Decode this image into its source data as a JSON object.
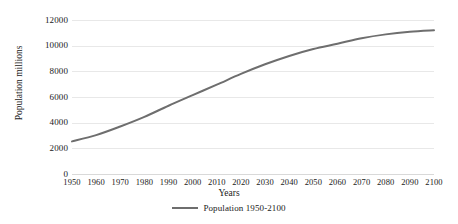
{
  "chart_data": {
    "type": "line",
    "title": "",
    "xlabel": "Years",
    "ylabel": "Population millions",
    "xlim": [
      1950,
      2100
    ],
    "ylim": [
      0,
      12000
    ],
    "ytick_step": 2000,
    "grid": true,
    "legend_position": "bottom-center",
    "line_color": "#6e6e6e",
    "x": [
      1950,
      1960,
      1970,
      1980,
      1990,
      2000,
      2010,
      2020,
      2030,
      2040,
      2050,
      2060,
      2070,
      2080,
      2090,
      2100
    ],
    "xticklabels": [
      "1950",
      "1960",
      "1970",
      "1980",
      "1990",
      "2000",
      "2010",
      "2020",
      "2030",
      "2040",
      "2050",
      "2060",
      "2070",
      "2080",
      "2090",
      "2100"
    ],
    "yticklabels": [
      "0",
      "2000",
      "4000",
      "6000",
      "8000",
      "10000",
      "12000"
    ],
    "yticks": [
      0,
      2000,
      4000,
      6000,
      8000,
      10000,
      12000
    ],
    "series": [
      {
        "name": "Population 1950-2100",
        "color": "#6e6e6e",
        "values": [
          2540,
          3030,
          3700,
          4450,
          5320,
          6145,
          6960,
          7800,
          8550,
          9200,
          9740,
          10150,
          10580,
          10880,
          11080,
          11200
        ]
      }
    ],
    "legend": [
      "Population 1950-2100"
    ]
  },
  "axes": {
    "y_title": "Population millions",
    "x_title": "Years"
  },
  "legend": {
    "entries": [
      {
        "label": "Population 1950-2100",
        "color": "#6e6e6e"
      }
    ]
  }
}
